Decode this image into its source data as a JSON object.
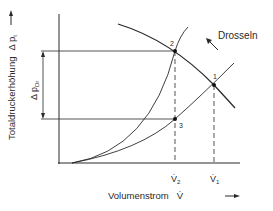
{
  "diagram": {
    "y_axis_label": "Totaldruckerhöhung",
    "y_axis_symbol": "Δ p",
    "y_axis_subscript": "t",
    "x_axis_label": "Volumenstrom",
    "x_axis_symbol": "V̇",
    "throttle_label": "Drosseln",
    "delta_label": "Δ p",
    "delta_subscript": "Dr",
    "points": [
      {
        "id": "1",
        "label": "1"
      },
      {
        "id": "2",
        "label": "2"
      },
      {
        "id": "3",
        "label": "3"
      }
    ],
    "x_ticks": [
      {
        "label": "V̇",
        "subscript": "2"
      },
      {
        "label": "V̇",
        "subscript": "1"
      }
    ],
    "colors": {
      "line": "#2a2a2a",
      "background": "#ffffff"
    }
  }
}
